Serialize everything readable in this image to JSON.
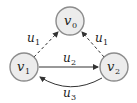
{
  "diagram": {
    "type": "directed-graph",
    "nodes": [
      {
        "id": "v0",
        "label": "v",
        "sub": "0",
        "x": 70,
        "y": 21
      },
      {
        "id": "v1",
        "label": "v",
        "sub": "1",
        "x": 24,
        "y": 67
      },
      {
        "id": "v2",
        "label": "v",
        "sub": "2",
        "x": 114,
        "y": 67
      }
    ],
    "edges": [
      {
        "from": "v1",
        "to": "v0",
        "style": "dashed",
        "label": "u",
        "sub": "1"
      },
      {
        "from": "v2",
        "to": "v0",
        "style": "dashed",
        "label": "u",
        "sub": "1"
      },
      {
        "from": "v1",
        "to": "v2",
        "style": "solid",
        "label": "u",
        "sub": "2"
      },
      {
        "from": "v2",
        "to": "v1",
        "style": "solid-curved",
        "label": "u",
        "sub": "3"
      }
    ],
    "colors": {
      "node_fill": "#ececec",
      "node_stroke": "#8c8c8c",
      "edge": "#333333"
    }
  }
}
